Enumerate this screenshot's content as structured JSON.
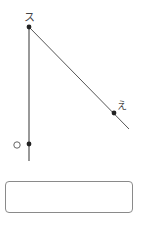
{
  "diagram": {
    "points": [
      {
        "id": "top",
        "label": "ス",
        "x": 29,
        "y": 27
      },
      {
        "id": "right",
        "label": "え",
        "x": 114,
        "y": 113
      },
      {
        "id": "bottom",
        "label": "O",
        "x": 29,
        "y": 144
      }
    ],
    "segments": [
      {
        "from": [
          29,
          27
        ],
        "to": [
          29,
          161
        ],
        "name": "vertical-line"
      },
      {
        "from": [
          29,
          27
        ],
        "to": [
          129,
          129
        ],
        "name": "diagonal-line"
      }
    ],
    "colors": {
      "line": "#555555",
      "point": "#222222",
      "label": "#444444"
    }
  },
  "answer": {
    "value": "",
    "placeholder": ""
  }
}
